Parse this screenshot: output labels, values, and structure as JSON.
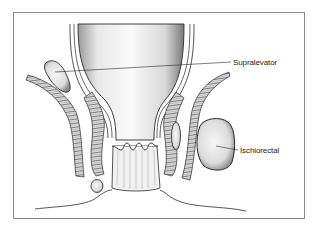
{
  "figure": {
    "type": "anatomical-line-drawing",
    "labels": [
      {
        "id": "supralevator",
        "text": "Supralevator"
      },
      {
        "id": "ischiorectal",
        "text": "Ischiorectal"
      }
    ],
    "structures": [
      "rectum",
      "anal-canal",
      "dentate-line",
      "levator-ani-muscle-left",
      "levator-ani-muscle-right",
      "external-sphincter-left",
      "external-sphincter-right",
      "supralevator-abscess",
      "intersphincteric-abscess",
      "perianal-abscess",
      "ischiorectal-abscess",
      "perineal-skin"
    ],
    "colors": {
      "ink": "#2a2a2a",
      "frame": "#8a8a8a",
      "background": "#ffffff"
    }
  }
}
